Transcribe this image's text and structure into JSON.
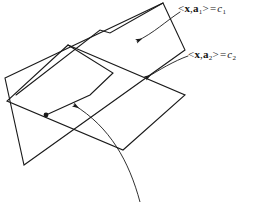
{
  "figure": {
    "background_color": "#ffffff",
    "stroke_color": "#1a1a1a",
    "width": 257,
    "height": 202
  },
  "labels": {
    "hyperplane_1": {
      "open_bracket": "<",
      "vector_x": "x",
      "comma": ",",
      "vector_a": "a",
      "subscript_a": "1",
      "close_bracket": ">",
      "equals": "=",
      "constant": "c",
      "subscript_c": "1",
      "full_text": "<x,a1> = c1"
    },
    "hyperplane_2": {
      "open_bracket": "<",
      "vector_x": "x",
      "comma": ",",
      "vector_a": "a",
      "subscript_a": "2",
      "close_bracket": ">",
      "equals": "=",
      "constant": "c",
      "subscript_c": "2",
      "full_text": "<x,a2> = c2"
    }
  },
  "shapes": {
    "plane_1": {
      "name": "tilted-plane",
      "points": "5,78 163,3 185,50 24,165"
    },
    "plane_1_inner_edge": {
      "name": "tilted-plane-fold",
      "points": "16,95 100,30 110,33 163,3"
    },
    "plane_2": {
      "name": "horizontal-plane",
      "points": "68,45 185,95 123,150 7,101"
    },
    "plane_2_inner_edge": {
      "name": "horizontal-plane-fold",
      "points": "68,45 113,73 90,95 46,115"
    },
    "intersection_dot": {
      "name": "intersection-point",
      "cx": 46,
      "cy": 115,
      "r": 2.2
    }
  },
  "leaders": {
    "arrow_1": {
      "name": "leader-to-tilted-plane",
      "path": "M 178,11 C 165,20 155,33 136,41",
      "tip": "133,42"
    },
    "arrow_2": {
      "name": "leader-to-horizontal-plane",
      "path": "M 186,55 C 172,60 158,70 145,78",
      "tip": "142,80"
    },
    "arrow_3": {
      "name": "leader-to-intersection-line",
      "path": "M 139,202 C 128,160 110,126 73,105",
      "tip": "70,104"
    }
  }
}
